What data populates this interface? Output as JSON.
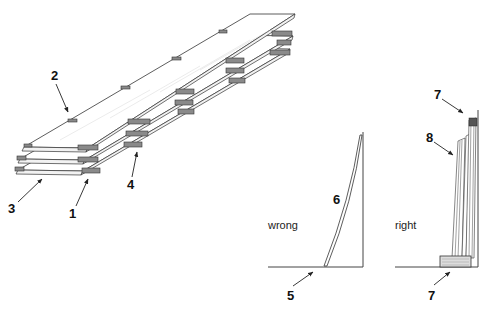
{
  "figure": {
    "type": "technical-illustration",
    "left_panel": {
      "description": "Three boards stacked with spacer sticks between layers",
      "labels": [
        {
          "id": "1",
          "text": "1"
        },
        {
          "id": "2",
          "text": "2"
        },
        {
          "id": "3",
          "text": "3"
        },
        {
          "id": "4",
          "text": "4"
        }
      ]
    },
    "middle_panel": {
      "caption": "wrong",
      "labels": [
        {
          "id": "5",
          "text": "5"
        },
        {
          "id": "6",
          "text": "6"
        }
      ]
    },
    "right_panel": {
      "caption": "right",
      "labels": [
        {
          "id": "7a",
          "text": "7"
        },
        {
          "id": "8",
          "text": "8"
        },
        {
          "id": "7b",
          "text": "7"
        }
      ]
    }
  }
}
